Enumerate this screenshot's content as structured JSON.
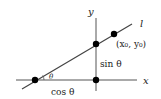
{
  "diagram": {
    "type": "unit-line-geometry",
    "colors": {
      "stroke": "#444444",
      "dot": "#000000",
      "text": "#222222"
    },
    "labels": {
      "x_axis": "x",
      "y_axis": "y",
      "line": "l",
      "point": "(x₀, y₀)",
      "sin": "sin θ",
      "cos": "cos θ",
      "angle": "θ"
    },
    "points": [
      {
        "name": "line-x-intercept",
        "x": 35,
        "y": 80
      },
      {
        "name": "origin",
        "x": 96,
        "y": 80
      },
      {
        "name": "line-y-intercept",
        "x": 96,
        "y": 44
      },
      {
        "name": "point-x0-y0",
        "x": 114,
        "y": 34
      }
    ]
  }
}
